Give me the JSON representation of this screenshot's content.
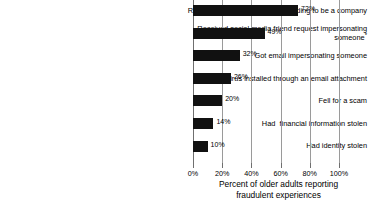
{
  "chart_data": {
    "type": "bar",
    "orientation": "horizontal",
    "title": "",
    "xlabel": "Percent of older adults reporting fraudulent experiences",
    "xlabel_lines": [
      "Percent of older adults reporting",
      "fraudulent experiences"
    ],
    "ylabel": "",
    "xlim": [
      0,
      100
    ],
    "grid": "vertical",
    "legend": "none",
    "categories": [
      "Received fraudulent email pretending to be a company",
      "Received social media friend request impersonating someone*",
      "Got email impersonating someone",
      "Had virus installed through an email attachment",
      "Fell for a scam",
      "Had  financial information stolen",
      "Had identity stolen"
    ],
    "category_lines": [
      [
        "Received fraudulent email pretending to be a company"
      ],
      [
        "Received social media friend request impersonating",
        "someone*"
      ],
      [
        "Got email impersonating someone"
      ],
      [
        "Had virus installed through an email attachment"
      ],
      [
        "Fell for a scam"
      ],
      [
        "Had  financial information stolen"
      ],
      [
        "Had identity stolen"
      ]
    ],
    "values": [
      72,
      49,
      32,
      26,
      20,
      14,
      10
    ],
    "value_labels": [
      "72%",
      "49%",
      "32%",
      "26%",
      "20%",
      "14%",
      "10%"
    ],
    "xticks": [
      0,
      20,
      40,
      60,
      80,
      100
    ],
    "xtick_labels": [
      "0%",
      "20%",
      "40%",
      "60%",
      "80%",
      "100%"
    ],
    "bar_color": "#111111",
    "gridline_color": "#9a9a9a",
    "axis_color": "#6f6f6f",
    "background_color": "#ffffff",
    "footnote_marker": "*"
  }
}
